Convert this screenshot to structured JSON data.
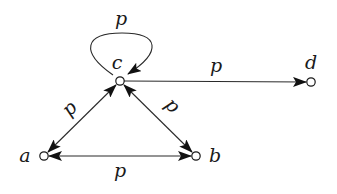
{
  "diagram": {
    "type": "directed-graph",
    "nodes": [
      {
        "id": "c",
        "label": "c",
        "x": 120,
        "y": 81
      },
      {
        "id": "d",
        "label": "d",
        "x": 311,
        "y": 82
      },
      {
        "id": "a",
        "label": "a",
        "x": 44,
        "y": 156
      },
      {
        "id": "b",
        "label": "b",
        "x": 196,
        "y": 156
      }
    ],
    "edges": [
      {
        "from": "c",
        "to": "c",
        "label": "p",
        "type": "self-loop"
      },
      {
        "from": "c",
        "to": "d",
        "label": "p",
        "type": "directed"
      },
      {
        "from": "c",
        "to": "a",
        "label": "p",
        "type": "bidirectional"
      },
      {
        "from": "c",
        "to": "b",
        "label": "p",
        "type": "bidirectional"
      },
      {
        "from": "a",
        "to": "b",
        "label": "p",
        "type": "bidirectional"
      }
    ]
  },
  "labels": {
    "node_c": "c",
    "node_d": "d",
    "node_a": "a",
    "node_b": "b",
    "edge_loop": "p",
    "edge_cd": "p",
    "edge_ca": "p",
    "edge_cb": "p",
    "edge_ab": "p"
  }
}
